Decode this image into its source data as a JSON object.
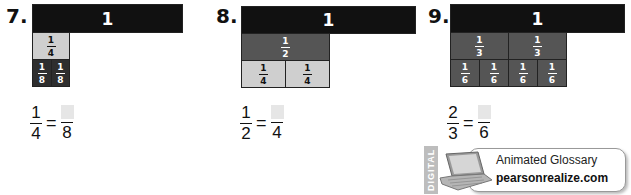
{
  "problems": [
    {
      "number": "7.",
      "whole_label": "1",
      "row1": [
        {
          "num": "1",
          "den": "4"
        }
      ],
      "row2": [
        {
          "num": "1",
          "den": "8"
        },
        {
          "num": "1",
          "den": "8"
        }
      ],
      "equation": {
        "left_num": "1",
        "left_den": "4",
        "equals": "=",
        "right_num": "",
        "right_den": "8"
      }
    },
    {
      "number": "8.",
      "whole_label": "1",
      "row1": [
        {
          "num": "1",
          "den": "2"
        }
      ],
      "row2": [
        {
          "num": "1",
          "den": "4"
        },
        {
          "num": "1",
          "den": "4"
        }
      ],
      "equation": {
        "left_num": "1",
        "left_den": "2",
        "equals": "=",
        "right_num": "",
        "right_den": "4"
      }
    },
    {
      "number": "9.",
      "whole_label": "1",
      "row1": [
        {
          "num": "1",
          "den": "3"
        },
        {
          "num": "1",
          "den": "3"
        }
      ],
      "row2": [
        {
          "num": "1",
          "den": "6"
        },
        {
          "num": "1",
          "den": "6"
        },
        {
          "num": "1",
          "den": "6"
        },
        {
          "num": "1",
          "den": "6"
        }
      ],
      "equation": {
        "left_num": "2",
        "left_den": "3",
        "equals": "=",
        "right_num": "",
        "right_den": "6"
      }
    }
  ],
  "badge": {
    "side_label": "DIGITAL",
    "icon": "laptop-icon",
    "title": "Animated Glossary",
    "link": "pearsonrealize.com"
  },
  "colors": {
    "whole_bar": "#111111",
    "light_tile": "#cfcfcf",
    "dark_tile": "#2e2e2e",
    "mid_tile": "#555555",
    "answer_box": "#e6e6e6"
  }
}
